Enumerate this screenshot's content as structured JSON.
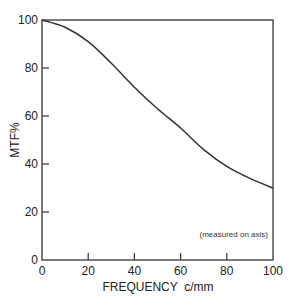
{
  "chart_data": {
    "type": "line",
    "title": "",
    "xlabel": "FREQUENCY  c/mm",
    "ylabel": "MTF%",
    "xlim": [
      0,
      100
    ],
    "ylim": [
      0,
      100
    ],
    "x_ticks": [
      0,
      20,
      40,
      60,
      80,
      100
    ],
    "y_ticks": [
      0,
      20,
      40,
      60,
      80,
      100
    ],
    "grid": false,
    "legend": null,
    "annotations": [
      "(measured on axis)"
    ],
    "series": [
      {
        "name": "MTF",
        "x": [
          0,
          10,
          20,
          30,
          40,
          50,
          60,
          70,
          80,
          90,
          100
        ],
        "y": [
          100,
          97,
          91,
          82,
          72,
          63,
          55,
          46,
          39,
          34,
          30
        ]
      }
    ]
  },
  "labels": {
    "xlabel": "FREQUENCY  c/mm",
    "ylabel": "MTF%",
    "annotation": "(measured on axis)",
    "x_ticks": [
      "0",
      "20",
      "40",
      "60",
      "80",
      "100"
    ],
    "y_ticks": [
      "0",
      "20",
      "40",
      "60",
      "80",
      "100"
    ]
  },
  "colors": {
    "line": "#333333",
    "axis": "#333333",
    "text": "#222222"
  }
}
